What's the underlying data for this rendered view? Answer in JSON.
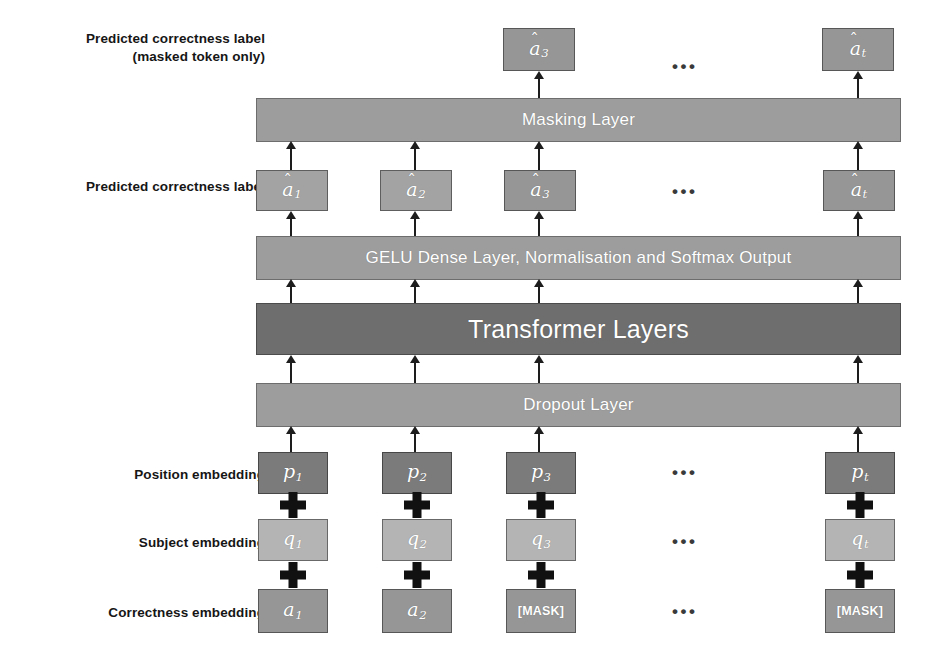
{
  "figure": {
    "ellipsis": "•••"
  },
  "colors": {
    "bar_light": "#9d9d9d",
    "bar_dark": "#6e6e6e",
    "token_dark": "#7b7b7b",
    "token_light": "#b4b4b4",
    "token_mid": "#969696",
    "text_on_bar": "#ffffff",
    "label_text": "#161616",
    "connector": "#1d1d1d"
  },
  "row_labels": {
    "predicted_masked": "Predicted correctness label\n(masked token only)",
    "predicted": "Predicted correctness label",
    "position": "Position embedding",
    "subject": "Subject embedding",
    "correctness": "Correctness embedding"
  },
  "layers": {
    "masking": "Masking Layer",
    "gelu_dense": "GELU Dense Layer, Normalisation and Softmax Output",
    "transformer": "Transformer Layers",
    "dropout": "Dropout Layer"
  },
  "rows": {
    "output_masked": {
      "name": "predicted-correctness-masked-row",
      "tokens": [
        {
          "base": "a",
          "sub": "3",
          "hat": true,
          "column": 3
        },
        {
          "base": "a",
          "sub": "t",
          "hat": true,
          "column": "t"
        }
      ]
    },
    "output_all": {
      "name": "predicted-correctness-row",
      "tokens": [
        {
          "base": "a",
          "sub": "1",
          "hat": true,
          "column": 1
        },
        {
          "base": "a",
          "sub": "2",
          "hat": true,
          "column": 2
        },
        {
          "base": "a",
          "sub": "3",
          "hat": true,
          "column": 3
        },
        {
          "base": "a",
          "sub": "t",
          "hat": true,
          "column": "t"
        }
      ]
    },
    "position_embedding": {
      "name": "position-embedding-row",
      "tokens": [
        {
          "base": "p",
          "sub": "1",
          "hat": false,
          "column": 1
        },
        {
          "base": "p",
          "sub": "2",
          "hat": false,
          "column": 2
        },
        {
          "base": "p",
          "sub": "3",
          "hat": false,
          "column": 3
        },
        {
          "base": "p",
          "sub": "t",
          "hat": false,
          "column": "t"
        }
      ]
    },
    "subject_embedding": {
      "name": "subject-embedding-row",
      "tokens": [
        {
          "base": "q",
          "sub": "1",
          "hat": false,
          "column": 1
        },
        {
          "base": "q",
          "sub": "2",
          "hat": false,
          "column": 2
        },
        {
          "base": "q",
          "sub": "3",
          "hat": false,
          "column": 3
        },
        {
          "base": "q",
          "sub": "t",
          "hat": false,
          "column": "t"
        }
      ]
    },
    "correctness_embedding": {
      "name": "correctness-embedding-row",
      "tokens": [
        {
          "base": "a",
          "sub": "1",
          "hat": false,
          "column": 1,
          "mask": false
        },
        {
          "base": "a",
          "sub": "2",
          "hat": false,
          "column": 2,
          "mask": false
        },
        {
          "mask": true,
          "mask_label": "[MASK]",
          "column": 3
        },
        {
          "mask": true,
          "mask_label": "[MASK]",
          "column": "t"
        }
      ]
    }
  },
  "operators": {
    "plus": "+"
  }
}
